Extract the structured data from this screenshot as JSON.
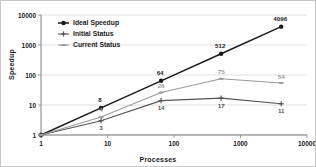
{
  "chart_data": {
    "type": "line",
    "title": "",
    "xlabel": "Processes",
    "ylabel": "Speedup",
    "xscale": "log",
    "yscale": "log",
    "xlim": [
      1,
      10000
    ],
    "ylim": [
      1,
      10000
    ],
    "x_ticks": [
      "1",
      "10",
      "100",
      "1000",
      "10000"
    ],
    "y_ticks": [
      "1",
      "10",
      "100",
      "1000",
      "10000"
    ],
    "grid": "horizontal",
    "legend_position": "upper-left-inside",
    "x": [
      1,
      8,
      64,
      512,
      4096
    ],
    "series": [
      {
        "name": "Ideal Speedup",
        "color": "#1a1a1a",
        "marker": "circle",
        "values": [
          1,
          8,
          64,
          512,
          4096
        ],
        "labels": [
          "",
          "8",
          "64",
          "512",
          "4096"
        ]
      },
      {
        "name": "Initial Status",
        "color": "#555555",
        "marker": "plus",
        "values": [
          1,
          3,
          14,
          17,
          11
        ],
        "labels": [
          "",
          "3",
          "14",
          "17",
          "11"
        ]
      },
      {
        "name": "Current Status",
        "color": "#9a9a9a",
        "marker": "dash",
        "values": [
          1,
          4,
          26,
          75,
          54
        ],
        "labels": [
          "",
          "4",
          "26",
          "75",
          "54"
        ]
      }
    ]
  },
  "axes": {
    "x_title": "Processes",
    "y_title": "Speedup"
  },
  "legend": {
    "items": [
      {
        "label": "Ideal Speedup"
      },
      {
        "label": "Initial Status"
      },
      {
        "label": "Current Status"
      }
    ]
  },
  "colors": {
    "ideal": "#1a1a1a",
    "initial": "#555555",
    "current": "#9a9a9a",
    "grid": "#d9d9d9",
    "axis": "#808080",
    "tick_text": "#1a1a1a",
    "label_light": "#9a9a9a",
    "background": "#ffffff"
  }
}
